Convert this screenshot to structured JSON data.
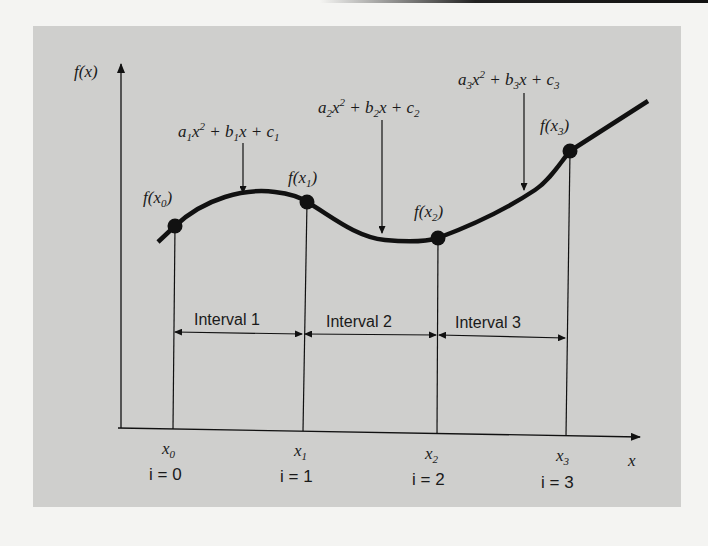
{
  "figure": {
    "y_axis_label": "f(x)",
    "x_axis_label": "x",
    "colors": {
      "background": "#f4f4f2",
      "panel": "#cfcfcd",
      "ink": "#111111"
    }
  },
  "polynomials": [
    {
      "a": "a",
      "sub": "1",
      "text": "a1x^2 + b1x + c1"
    },
    {
      "a": "a",
      "sub": "2",
      "text": "a2x^2 + b2x + c2"
    },
    {
      "a": "a",
      "sub": "3",
      "text": "a3x^2 + b3x + c3"
    }
  ],
  "points": [
    {
      "label": "f(x0)",
      "sub": "0"
    },
    {
      "label": "f(x1)",
      "sub": "1"
    },
    {
      "label": "f(x2)",
      "sub": "2"
    },
    {
      "label": "f(x3)",
      "sub": "3"
    }
  ],
  "intervals": [
    "Interval 1",
    "Interval 2",
    "Interval 3"
  ],
  "x_ticks": [
    {
      "label": "x0",
      "sub": "0",
      "index": "i = 0"
    },
    {
      "label": "x1",
      "sub": "1",
      "index": "i = 1"
    },
    {
      "label": "x2",
      "sub": "2",
      "index": "i = 2"
    },
    {
      "label": "x3",
      "sub": "3",
      "index": "i = 3"
    }
  ]
}
